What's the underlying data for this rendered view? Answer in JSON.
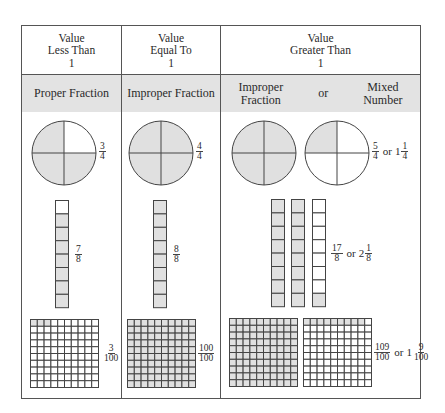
{
  "columns": [
    {
      "header": [
        "Value",
        "Less Than",
        "1"
      ],
      "subheader": "Proper Fraction"
    },
    {
      "header": [
        "Value",
        "Equal To",
        "1"
      ],
      "subheader": "Improper Fraction"
    },
    {
      "header": [
        "Value",
        "Greater Than",
        "1"
      ],
      "subheader_left": [
        "Improper",
        "Fraction"
      ],
      "subheader_or": "or",
      "subheader_right": [
        "Mixed",
        "Number"
      ]
    }
  ],
  "circles": {
    "col1": {
      "shaded_quarters": 3,
      "label": {
        "num": "3",
        "den": "4"
      }
    },
    "col2": {
      "shaded_quarters": 4,
      "label": {
        "num": "4",
        "den": "4"
      }
    },
    "col3": {
      "shaded_quarters": [
        4,
        1
      ],
      "label": {
        "num": "5",
        "den": "4",
        "or": "or",
        "whole": "1",
        "mnum": "1",
        "mden": "4"
      }
    }
  },
  "bars": {
    "col1": {
      "shaded_eighths": 7,
      "label": {
        "num": "7",
        "den": "8"
      }
    },
    "col2": {
      "shaded_eighths": 8,
      "label": {
        "num": "8",
        "den": "8"
      }
    },
    "col3": {
      "shaded_eighths": [
        8,
        8,
        1
      ],
      "label": {
        "num": "17",
        "den": "8",
        "or": "or",
        "whole": "2",
        "mnum": "1",
        "mden": "8"
      }
    }
  },
  "grids": {
    "col1": {
      "shaded_hundredths": 3,
      "label": {
        "num": "3",
        "den": "100"
      }
    },
    "col2": {
      "shaded_hundredths": 100,
      "label": {
        "num": "100",
        "den": "100"
      }
    },
    "col3": {
      "shaded_hundredths": [
        100,
        9
      ],
      "label": {
        "num": "109",
        "den": "100",
        "or": "or",
        "whole": "1",
        "mnum": "9",
        "mden": "100"
      }
    }
  },
  "colors": {
    "shade": "#e0e0e0",
    "line": "#444444",
    "header_bg": "#e3e3e3"
  }
}
